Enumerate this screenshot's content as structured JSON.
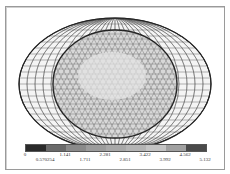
{
  "chart_data": {
    "type": "heatmap",
    "title": "",
    "colorbar": {
      "ticks_top": [
        "0",
        "1.141",
        "2.281",
        "3.422",
        "4.562"
      ],
      "ticks_bottom": [
        "0.570254",
        "1.711",
        "2.851",
        "3.992",
        "5.132"
      ],
      "range": [
        0,
        5.132
      ],
      "colors": [
        "#2a2a2a",
        "#6a6a6a",
        "#8a8a8a",
        "#9c9c9c",
        "#a8a8a8",
        "#b4b4b4",
        "#c4c4c4",
        "#a0a0a0",
        "#4a4a4a"
      ]
    }
  },
  "colorbar": {
    "labels": [
      {
        "text": "0",
        "x": 25,
        "row": 0
      },
      {
        "text": "0.570254",
        "x": 45,
        "row": 1
      },
      {
        "text": "1.141",
        "x": 65,
        "row": 0
      },
      {
        "text": "1.711",
        "x": 85,
        "row": 1
      },
      {
        "text": "2.281",
        "x": 105,
        "row": 0
      },
      {
        "text": "2.851",
        "x": 125,
        "row": 1
      },
      {
        "text": "3.422",
        "x": 145,
        "row": 0
      },
      {
        "text": "3.992",
        "x": 165,
        "row": 1
      },
      {
        "text": "4.562",
        "x": 185,
        "row": 0
      },
      {
        "text": "5.132",
        "x": 205,
        "row": 1
      }
    ]
  }
}
